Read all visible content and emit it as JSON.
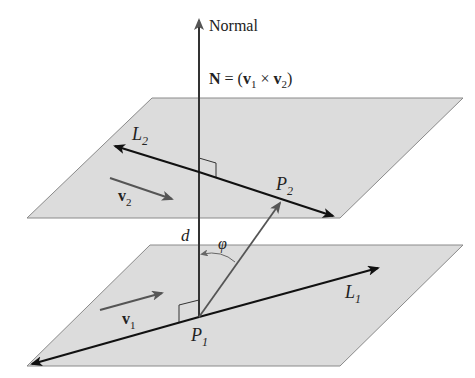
{
  "colors": {
    "plane_fill": "#dcdcdc",
    "plane_edge": "#8a8a8a",
    "line_dark": "#111111",
    "vector_gray": "#555555",
    "background": "#ffffff"
  },
  "labels": {
    "normal": "Normal",
    "normal_formula_N": "N",
    "normal_formula_eq": " = (",
    "normal_formula_v1": "v",
    "normal_formula_v1_sub": "1",
    "normal_formula_times": " × ",
    "normal_formula_v2": "v",
    "normal_formula_v2_sub": "2",
    "normal_formula_close": ")",
    "L2": "L",
    "L2_sub": "2",
    "L1": "L",
    "L1_sub": "1",
    "v2": "v",
    "v2_sub": "2",
    "v1": "v",
    "v1_sub": "1",
    "P2": "P",
    "P2_sub": "2",
    "P1": "P",
    "P1_sub": "1",
    "d": "d",
    "phi": "φ"
  },
  "geometry": {
    "top_plane": [
      [
        152,
        98
      ],
      [
        463,
        98
      ],
      [
        340,
        218
      ],
      [
        27,
        218
      ]
    ],
    "bottom_plane": [
      [
        150,
        245
      ],
      [
        463,
        245
      ],
      [
        340,
        366
      ],
      [
        27,
        366
      ]
    ],
    "normal_line": {
      "x": 199,
      "y_top": 17,
      "y_bottom": 317
    },
    "P1": [
      199,
      317
    ],
    "P2": [
      281,
      202
    ],
    "L1": {
      "from": [
        199,
        317
      ],
      "tip_pos": [
        380,
        268
      ],
      "tip_neg": [
        30,
        365
      ]
    },
    "L2": {
      "tip_left": [
        113,
        147
      ],
      "tip_right": [
        335,
        217
      ]
    },
    "v1": {
      "from": [
        100,
        310
      ],
      "to": [
        163,
        293
      ]
    },
    "v2": {
      "from": [
        110,
        178
      ],
      "to": [
        173,
        199
      ]
    }
  }
}
